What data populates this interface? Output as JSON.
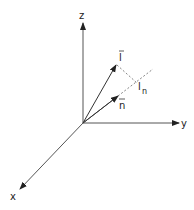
{
  "diagram": {
    "axes": {
      "z": {
        "label": "z"
      },
      "y": {
        "label": "y"
      },
      "x": {
        "label": "x"
      }
    },
    "vectors": {
      "l": {
        "label": "l",
        "has_arrow_accent": true
      },
      "n": {
        "label": "n",
        "has_arrow_accent": true
      }
    },
    "projection": {
      "label_main": "l",
      "label_sub": "n"
    },
    "colors": {
      "line": "#333333",
      "dashed": "#555555",
      "background": "#ffffff"
    }
  }
}
